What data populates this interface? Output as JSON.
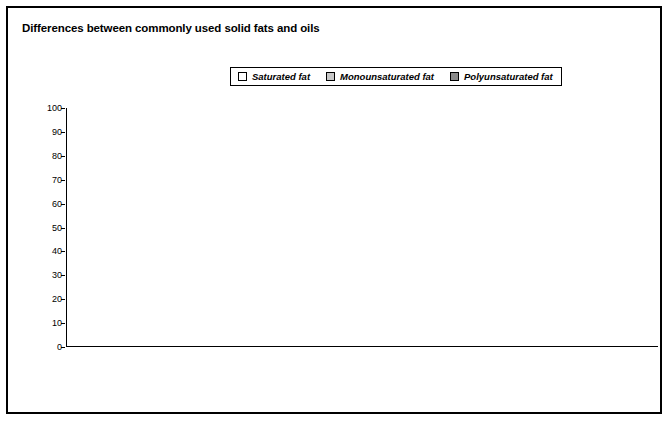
{
  "title": "Differences between commonly used solid fats and oils",
  "legend": [
    {
      "label": "Saturated fat",
      "color": "#ffffff",
      "key": "saturated"
    },
    {
      "label": "Monounsaturated fat",
      "color": "#c8c8c8",
      "key": "monounsaturated"
    },
    {
      "label": "Polyunsaturated fat",
      "color": "#8a8a8a",
      "key": "polyunsaturated"
    }
  ],
  "groups": [
    {
      "label": "Solid fats",
      "start": 0,
      "end": 8
    },
    {
      "label": "Oils",
      "start": 9,
      "end": 17
    }
  ],
  "chart_data": {
    "type": "bar",
    "subtype": "stacked-column",
    "title": "Differences between commonly used solid fats and oils",
    "xlabel": "",
    "ylabel": "Fatty acid composition (% of total)",
    "ylim": [
      0,
      100
    ],
    "yticks": [
      0,
      10,
      20,
      30,
      40,
      50,
      60,
      70,
      80,
      90,
      100
    ],
    "grid": false,
    "legend_position": "top-center",
    "categories": [
      "Coconut oil",
      "Palm kernel oil",
      "Butter",
      "Beef fat (tallow)",
      "Palm oil",
      "Pork fat (lard)",
      "Chicken fat",
      "Shortening",
      "Stick margarine",
      "Cottonseed oil",
      "Soft margarine",
      "Peanut oil",
      "Soybean oil",
      "Olive oil",
      "Corn oil",
      "Sunflower oil",
      "Canola oil",
      "Safflower oil"
    ],
    "category_footnotes": {
      "Shortening": "1",
      "Stick margarine": "2",
      "Soft margarine": "2"
    },
    "series": [
      {
        "name": "Saturated fat",
        "color": "#ffffff",
        "values": [
          92,
          86,
          68,
          52,
          51,
          41,
          31,
          25,
          19,
          27,
          20,
          18,
          15,
          14,
          13,
          11,
          7,
          9
        ]
      },
      {
        "name": "Monounsaturated fat",
        "color": "#c8c8c8",
        "values": [
          5,
          10,
          28,
          44,
          39,
          47,
          47,
          45,
          50,
          19,
          34,
          49,
          25,
          74,
          30,
          20,
          64,
          76
        ]
      },
      {
        "name": "Polyunsaturated fat",
        "color": "#8a8a8a",
        "values": [
          3,
          4,
          4,
          4,
          10,
          12,
          22,
          30,
          31,
          54,
          46,
          33,
          60,
          12,
          57,
          69,
          29,
          15
        ]
      }
    ]
  }
}
